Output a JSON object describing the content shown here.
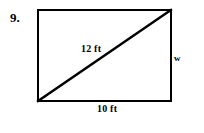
{
  "page": {
    "background_color": "#ffffff",
    "width": 204,
    "height": 133
  },
  "problem": {
    "number": "9.",
    "figure_type": "rectangle-with-diagonal",
    "stroke_color": "#000000",
    "stroke_width": 2,
    "fill_color": "#ffffff"
  },
  "figure": {
    "rectangle": {
      "left": 38,
      "top": 10,
      "right": 171,
      "bottom": 101
    },
    "diagonal": {
      "x1": 38,
      "y1": 101,
      "x2": 171,
      "y2": 10
    }
  },
  "labels": {
    "diagonal": "12 ft",
    "base": "10 ft",
    "height": "w"
  }
}
